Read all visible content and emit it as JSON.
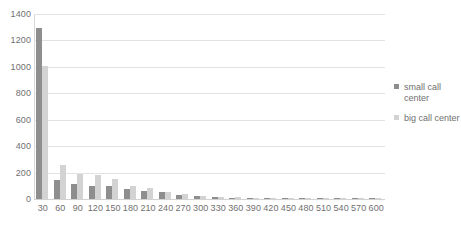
{
  "chart_data": {
    "type": "bar",
    "title": "",
    "xlabel": "",
    "ylabel": "",
    "ylim": [
      0,
      1400
    ],
    "ytick_step": 200,
    "grid": true,
    "legend_position": "right",
    "categories": [
      "30",
      "60",
      "90",
      "120",
      "150",
      "180",
      "210",
      "240",
      "270",
      "300",
      "330",
      "360",
      "390",
      "420",
      "450",
      "480",
      "510",
      "540",
      "570",
      "600"
    ],
    "ytick_labels": [
      "1400",
      "1200",
      "1000",
      "800",
      "600",
      "400",
      "200",
      "0"
    ],
    "series": [
      {
        "name": "small call center",
        "color": "#8e8e8e",
        "values": [
          1295,
          145,
          110,
          100,
          100,
          75,
          60,
          50,
          30,
          22,
          14,
          10,
          8,
          7,
          5,
          4,
          4,
          3,
          3,
          3
        ]
      },
      {
        "name": "big call center",
        "color": "#d3d3d3",
        "values": [
          1010,
          258,
          190,
          180,
          155,
          95,
          85,
          55,
          35,
          25,
          16,
          12,
          9,
          7,
          6,
          5,
          4,
          4,
          3,
          3
        ]
      }
    ]
  },
  "legend": {
    "entries": [
      {
        "label": "small call center",
        "swatch": "small-call-center-swatch"
      },
      {
        "label": "big call center",
        "swatch": "big-call-center-swatch"
      }
    ]
  }
}
